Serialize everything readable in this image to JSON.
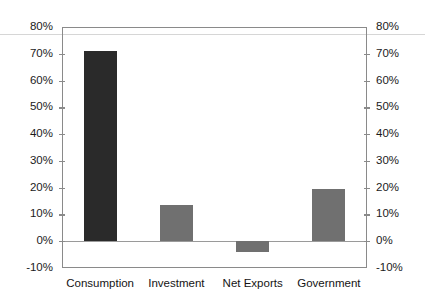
{
  "chart_data": {
    "type": "bar",
    "title": "",
    "subtitle": "",
    "xlabel": "",
    "ylabel": "",
    "categories": [
      "Consumption",
      "Investment",
      "Net Exports",
      "Government"
    ],
    "values": [
      71,
      13.5,
      -4,
      19.5
    ],
    "bar_colors": [
      "#2a2a2a",
      "#707070",
      "#707070",
      "#707070"
    ],
    "ylim": [
      -10,
      80
    ],
    "ytick_values": [
      80,
      70,
      60,
      50,
      40,
      30,
      20,
      10,
      0,
      -10
    ],
    "ytick_labels_left": [
      "80%",
      "70%",
      "60%",
      "50%",
      "40%",
      "30%",
      "20%",
      "10%",
      "0%",
      "-10%"
    ],
    "ytick_labels_right": [
      "80%",
      "70%",
      "60%",
      "50%",
      "40%",
      "30%",
      "20%",
      "10%",
      "0%",
      "-10%"
    ],
    "grid": false,
    "legend": false,
    "legend_position": "none",
    "dual_axis": true,
    "baseline_value": 0,
    "annotations": []
  },
  "axis": {
    "line_color": "#8a8a8a",
    "baseline_color": "#9a9a9a",
    "label_color": "#1b1b1b"
  },
  "artifact": {
    "rule_color": "#d6d6d6"
  }
}
